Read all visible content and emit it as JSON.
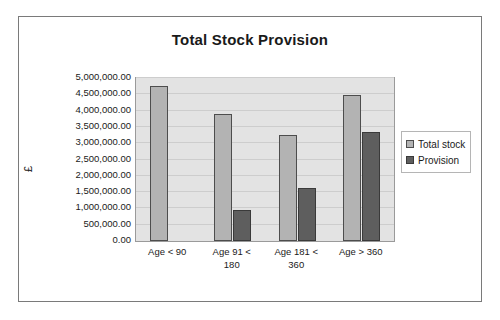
{
  "chart_data": {
    "type": "bar",
    "title": "Total Stock Provision",
    "xlabel": "",
    "ylabel": "£",
    "categories": [
      "Age < 90",
      "Age 91 < 180",
      "Age 181 < 360",
      "Age > 360"
    ],
    "category_lines": [
      [
        "Age < 90"
      ],
      [
        "Age 91 <",
        "180"
      ],
      [
        "Age 181 <",
        "360"
      ],
      [
        "Age > 360"
      ]
    ],
    "series": [
      {
        "name": "Total stock",
        "color": "#b3b3b3",
        "values": [
          4750000,
          3900000,
          3250000,
          4475000
        ]
      },
      {
        "name": "Provision",
        "color": "#5e5e5e",
        "values": [
          0,
          960000,
          1625000,
          3350000
        ]
      }
    ],
    "ylim": [
      0,
      5000000
    ],
    "ytick_values": [
      5000000,
      4500000,
      4000000,
      3500000,
      3000000,
      2500000,
      2000000,
      1500000,
      1000000,
      500000,
      0
    ],
    "ytick_labels": [
      "5,000,000.00",
      "4,500,000.00",
      "4,000,000.00",
      "3,500,000.00",
      "3,000,000.00",
      "2,500,000.00",
      "2,000,000.00",
      "1,500,000.00",
      "1,000,000.00",
      "500,000.00",
      "0.00"
    ],
    "grid": true,
    "legend_position": "right",
    "plot_background": "#e3e3e3",
    "frame_border_color": "#7a7a7a"
  },
  "legend": {
    "entries": [
      {
        "label": "Total stock"
      },
      {
        "label": "Provision"
      }
    ]
  }
}
